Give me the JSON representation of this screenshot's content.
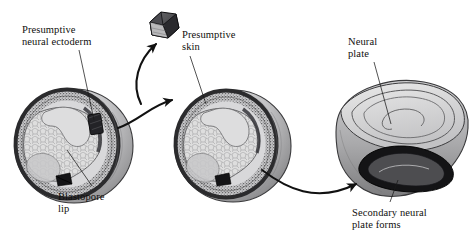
{
  "figure": {
    "background_color": "#ffffff",
    "labels": [
      {
        "name": "presumptive-neural-ectoderm",
        "line1": "Presumptive",
        "line2": "neural ectoderm",
        "anchor": "left-embryo-graft-site"
      },
      {
        "name": "presumptive-skin",
        "line1": "Presumptive",
        "line2": "skin",
        "anchor": "middle-embryo-graft-site"
      },
      {
        "name": "blastopore-lip",
        "line1": "Blastopore",
        "line2": "lip",
        "anchor": "left-embryo-blastopore"
      },
      {
        "name": "neural-plate",
        "line1": "Neural",
        "line2": "plate",
        "anchor": "right-embryo-top"
      },
      {
        "name": "secondary-neural-plate-forms",
        "line1": "Secondary neural",
        "line2": "plate forms",
        "anchor": "right-embryo-ventral"
      }
    ],
    "structures": [
      {
        "name": "donor-embryo",
        "role": "left embryo, cutaway gastrula with graft site marked"
      },
      {
        "name": "graft-tissue-block",
        "role": "excised dorsal lip tissue cube"
      },
      {
        "name": "host-embryo",
        "role": "middle embryo, cutaway gastrula receiving graft"
      },
      {
        "name": "result-embryo",
        "role": "right embryo, neurula with primary and secondary neural plates"
      }
    ],
    "arrows": [
      {
        "name": "excision-arrow",
        "from": "donor-embryo",
        "to": "graft-tissue-block"
      },
      {
        "name": "transplant-arrow",
        "from": "graft-tissue-block",
        "to": "host-embryo"
      },
      {
        "name": "development-arrow",
        "from": "host-embryo",
        "to": "result-embryo"
      }
    ],
    "palette": {
      "ink": "#100f0d",
      "outline": "#2b2b2b",
      "dark_band": "#2e2e30",
      "mid_gray": "#9d9d9f",
      "light_gray": "#c9c9cb",
      "pale_gray": "#e3e3e3",
      "stipple": "#6e6e70",
      "white": "#ffffff"
    }
  }
}
